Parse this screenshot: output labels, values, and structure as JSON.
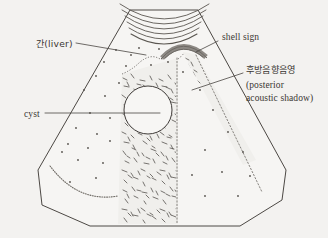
{
  "figure": {
    "type": "medical-illustration",
    "modality": "ultrasound-schematic",
    "background_color": "#f3f2f0",
    "ink_color": "#4c4844"
  },
  "labels": {
    "liver": {
      "text": "간(liver)",
      "korean": "간",
      "english": "liver",
      "x": 36,
      "y": 45
    },
    "cyst": {
      "text": "cyst",
      "x": 24,
      "y": 115
    },
    "shell_sign": {
      "text": "shell sign",
      "x": 222,
      "y": 42
    },
    "shadow_ko": {
      "text": "후방음향음영",
      "x": 246,
      "y": 72
    },
    "shadow_en_line1": {
      "text": "(posterior",
      "x": 246,
      "y": 87
    },
    "shadow_en_line2": {
      "text": "acoustic shadow)",
      "x": 246,
      "y": 100
    }
  },
  "regions": {
    "liver_parenchyma": "speckled sector field",
    "acoustic_shadow_main": "central vertical hatched band below the stone",
    "acoustic_shadow_lateral": "narrow hatched band along right sector margin",
    "cyst_lesion": "anechoic round circle",
    "near_field_arcs": "five curved reverberation lines at transducer face",
    "diaphragm": "dotted curved line at lower left"
  },
  "counts": {
    "near_field_arcs": 5,
    "leader_lines": 4
  },
  "colors": {
    "shell_sign_band": "#8d8984",
    "outline": "#4c4844",
    "speckle": "#55514c",
    "paper": "#f3f2f0"
  }
}
